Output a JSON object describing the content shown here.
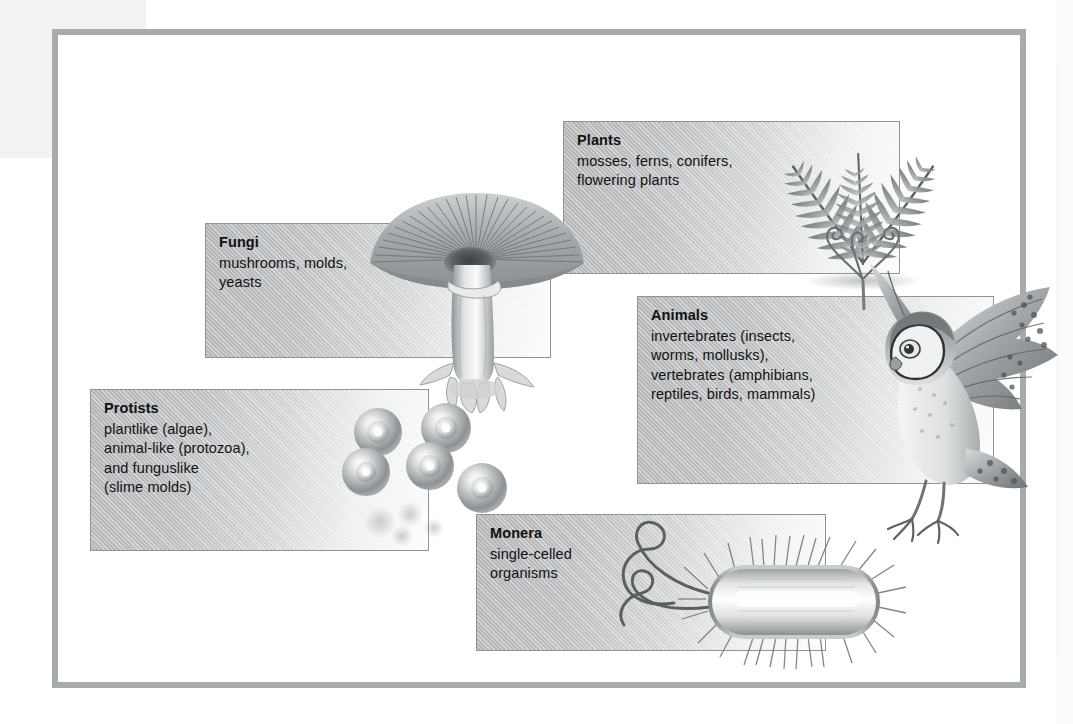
{
  "figure": {
    "caption": "",
    "frame_color": "#a8abac",
    "panel_border_color": "#909496",
    "panel_fill_from": "#b3b5b6",
    "panel_fill_to": "#fcfcfc",
    "text_color": "#111111"
  },
  "kingdoms": [
    {
      "id": "fungi",
      "title": "Fungi",
      "description": "mushrooms, molds,\nyeasts",
      "illustration": "mushroom-illustration"
    },
    {
      "id": "plants",
      "title": "Plants",
      "description": "mosses, ferns, conifers,\nflowering plants",
      "illustration": "fern-illustration"
    },
    {
      "id": "animals",
      "title": "Animals",
      "description": "invertebrates (insects,\nworms, mollusks),\nvertebrates (amphibians,\nreptiles, birds, mammals)",
      "illustration": "owl-illustration"
    },
    {
      "id": "protists",
      "title": "Protists",
      "description": "plantlike (algae),\nanimal-like (protozoa),\nand funguslike\n(slime molds)",
      "illustration": "protist-cells-illustration"
    },
    {
      "id": "monera",
      "title": "Monera",
      "description": "single-celled\norganisms",
      "illustration": "bacterium-illustration"
    }
  ]
}
